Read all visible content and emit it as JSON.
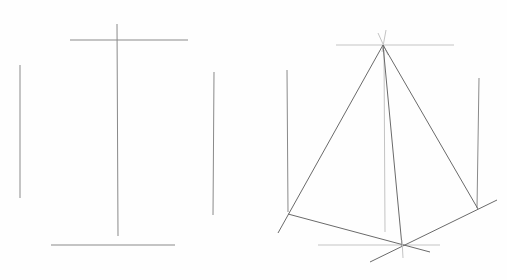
{
  "image": {
    "description": "Pencil sketch of pyramid construction lines: left shows vertical and horizontal guide lines, right shows a triangular pyramid drawn over guide lines",
    "colors": {
      "background": "#fefefe",
      "line": "#8a8a8a",
      "dark_line": "#6a6a6a",
      "faint_line": "#c4c4c4"
    }
  }
}
